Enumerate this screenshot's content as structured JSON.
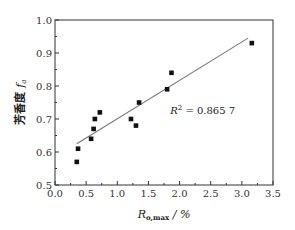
{
  "chart_data": {
    "type": "scatter",
    "title": "",
    "xlabel": "R_o,max / %",
    "xlabel_main": "R",
    "xlabel_sub": "o,max",
    "xlabel_unit": " / %",
    "ylabel": "芳香度 f_a",
    "ylabel_main": "芳香度 ",
    "ylabel_sym": "f",
    "ylabel_sub": "a",
    "xlim": [
      0.0,
      3.5
    ],
    "ylim": [
      0.5,
      1.0
    ],
    "xticks": [
      "0.0",
      "0.5",
      "1.0",
      "1.5",
      "2.0",
      "2.5",
      "3.0",
      "3.5"
    ],
    "yticks": [
      "0.5",
      "0.6",
      "0.7",
      "0.8",
      "0.9",
      "1.0"
    ],
    "grid": false,
    "legend": null,
    "series": [
      {
        "name": "samples",
        "marker": "square",
        "points": [
          {
            "x": 0.35,
            "y": 0.57
          },
          {
            "x": 0.37,
            "y": 0.61
          },
          {
            "x": 0.58,
            "y": 0.64
          },
          {
            "x": 0.62,
            "y": 0.67
          },
          {
            "x": 0.64,
            "y": 0.7
          },
          {
            "x": 0.72,
            "y": 0.72
          },
          {
            "x": 1.22,
            "y": 0.7
          },
          {
            "x": 1.3,
            "y": 0.68
          },
          {
            "x": 1.35,
            "y": 0.75
          },
          {
            "x": 1.8,
            "y": 0.79
          },
          {
            "x": 1.87,
            "y": 0.84
          },
          {
            "x": 3.16,
            "y": 0.93
          }
        ]
      }
    ],
    "fit_line": {
      "x": [
        0.35,
        3.1
      ],
      "y": [
        0.625,
        0.945
      ]
    },
    "annotations": [
      {
        "text_main": "R",
        "text_sup": "2",
        "text_rest": " = 0.865 7",
        "x": 1.85,
        "y": 0.715
      }
    ]
  },
  "colors": {
    "axis": "#333333",
    "marker": "#111111",
    "fit_line": "#777777"
  }
}
